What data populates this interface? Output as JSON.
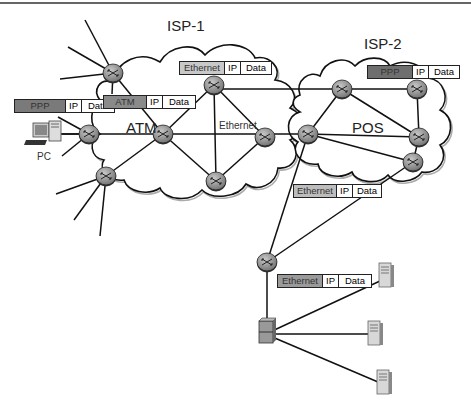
{
  "labels": {
    "isp1": "ISP-1",
    "isp2": "ISP-2",
    "atm": "ATM",
    "pos": "POS",
    "ethernet": "Ethernet",
    "pc": "PC"
  },
  "packets": [
    {
      "id": "pc-ppp",
      "l2": "PPP",
      "l2_color": "#7a7a7a",
      "l3": "IP",
      "payload": "Data"
    },
    {
      "id": "isp1-atm",
      "l2": "ATM",
      "l2_color": "#8a8a8a",
      "l3": "IP",
      "payload": "Data"
    },
    {
      "id": "isp1-ethernet",
      "l2": "Ethernet",
      "l2_color": "#c8c8c8",
      "l3": "IP",
      "payload": "Data"
    },
    {
      "id": "isp2-ppp",
      "l2": "PPP",
      "l2_color": "#6e6e6e",
      "l3": "IP",
      "payload": "Data"
    },
    {
      "id": "uplink-ethernet",
      "l2": "Ethernet",
      "l2_color": "#bdbdbd",
      "l3": "IP",
      "payload": "Data"
    },
    {
      "id": "lan-ethernet",
      "l2": "Ethernet",
      "l2_color": "#9a9a9a",
      "l3": "IP",
      "payload": "Data"
    }
  ],
  "colors": {
    "router_fill": "#9a9a9a",
    "line": "#111111",
    "cloud_stroke": "#111111"
  }
}
